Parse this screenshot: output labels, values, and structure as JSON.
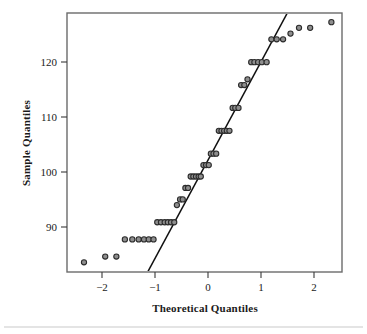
{
  "figure": {
    "partial_title": "",
    "background_color": "#ffffff",
    "frame_color": "#6b6b6b",
    "point_fill": "#8e8e8e",
    "point_stroke": "#2b2b2b",
    "line_color": "#101010"
  },
  "chart_data": {
    "type": "scatter",
    "title": "",
    "xlabel": "Theoretical Quantiles",
    "ylabel": "Sample Quantiles",
    "xlim": [
      -2.65,
      2.53
    ],
    "ylim": [
      83.3,
      128.6
    ],
    "xticks": [
      -2,
      -1,
      0,
      1,
      2
    ],
    "xticklabels": [
      "−2",
      "−1",
      "0",
      "1",
      "2"
    ],
    "yticks": [
      90,
      100,
      110,
      120
    ],
    "yticklabels": [
      "90",
      "100",
      "110",
      "120"
    ],
    "grid": false,
    "legend": false,
    "marker": "open-circle",
    "series": [
      {
        "name": "Sample quantiles",
        "x": [
          -2.33,
          -1.93,
          -1.72,
          -1.56,
          -1.42,
          -1.3,
          -1.2,
          -1.11,
          -1.02,
          -0.95,
          -0.88,
          -0.81,
          -0.75,
          -0.69,
          -0.63,
          -0.58,
          -0.52,
          -0.47,
          -0.42,
          -0.37,
          -0.32,
          -0.27,
          -0.22,
          -0.17,
          -0.13,
          -0.08,
          -0.03,
          0.02,
          0.06,
          0.11,
          0.16,
          0.21,
          0.26,
          0.31,
          0.36,
          0.41,
          0.47,
          0.52,
          0.58,
          0.63,
          0.69,
          0.75,
          0.82,
          0.88,
          0.95,
          1.02,
          1.11,
          1.2,
          1.3,
          1.42,
          1.56,
          1.72,
          1.93,
          2.33
        ],
        "y": [
          85,
          86,
          86,
          89,
          89,
          89,
          89,
          89,
          89,
          92,
          92,
          92,
          92,
          92,
          92,
          95,
          96,
          96,
          98,
          98,
          100,
          100,
          100,
          100,
          100,
          102,
          102,
          102,
          104,
          104,
          104,
          108,
          108,
          108,
          108,
          108,
          112,
          112,
          112,
          116,
          116,
          117,
          120,
          120,
          120,
          120,
          120,
          124,
          124,
          124,
          125,
          126,
          126,
          127
        ]
      }
    ],
    "reference_line": {
      "description": "QQ reference line through first and third quartiles",
      "x_start": -1.13,
      "y_start": 83.3,
      "x_end": 1.5,
      "y_end": 128.6
    }
  }
}
